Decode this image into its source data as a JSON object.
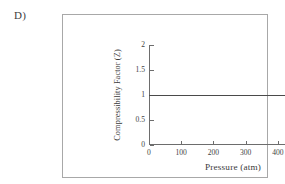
{
  "panel": {
    "label": "D)"
  },
  "chart_data": {
    "type": "line",
    "title": "",
    "subtitle": "",
    "xlabel": "Pressure (atm)",
    "ylabel": "Compressibility Factor (Z)",
    "xlim": [
      0,
      515
    ],
    "ylim": [
      0,
      2
    ],
    "xticks": [
      0,
      100,
      200,
      300,
      400,
      500
    ],
    "xtick_labels": [
      "0",
      "100",
      "200",
      "300",
      "400",
      "500"
    ],
    "yticks": [
      0,
      0.5,
      1,
      1.5,
      2
    ],
    "ytick_labels": [
      "0",
      "0.5",
      "1",
      "1.5",
      "2"
    ],
    "grid": false,
    "legend": false,
    "legend_position": "none",
    "annotations": [],
    "series": [
      {
        "name": "Ideal gas",
        "color": "#4a4a4a",
        "x": [
          0,
          100,
          200,
          300,
          400,
          500,
          515
        ],
        "values": [
          1,
          1,
          1,
          1,
          1,
          1,
          1
        ]
      }
    ]
  },
  "style": {
    "axis_color": "#6d6d6d",
    "line_color": "#4a4a4a",
    "frame_color": "#a8a8a8",
    "text_color": "#3a3a3a",
    "background": "#ffffff"
  }
}
